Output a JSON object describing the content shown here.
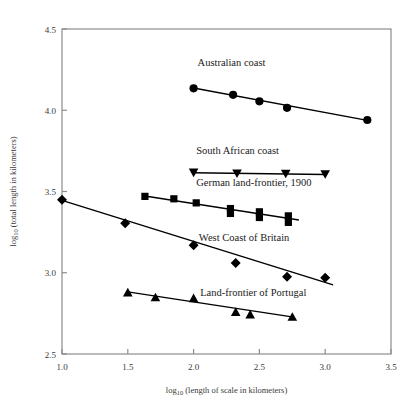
{
  "chart_data": {
    "type": "scatter",
    "title": "",
    "xlabel": "log10 (length of scale in kilometers)",
    "ylabel": "log10 (total length in kilometers)",
    "xlim": [
      1.0,
      3.5
    ],
    "ylim": [
      2.5,
      4.5
    ],
    "xticks": [
      "1.0",
      "1.5",
      "2.0",
      "2.5",
      "3.0",
      "3.5"
    ],
    "xtick_values": [
      1.0,
      1.5,
      2.0,
      2.5,
      3.0,
      3.5
    ],
    "yticks": [
      "2.5",
      "3.0",
      "3.5",
      "4.0",
      "4.5"
    ],
    "ytick_values": [
      2.5,
      3.0,
      3.5,
      4.0,
      4.5
    ],
    "grid": false,
    "legend_position": "inline-annotations",
    "marker_color": "#000000",
    "line_color": "#000000",
    "frame_color": "#8c8c8c",
    "series": [
      {
        "name": "Australian coast",
        "marker": "circle",
        "label": "Australian coast",
        "label_x": 2.03,
        "label_y": 4.27,
        "points": [
          {
            "x": 2.0,
            "y": 4.135
          },
          {
            "x": 2.3,
            "y": 4.095
          },
          {
            "x": 2.5,
            "y": 4.055
          },
          {
            "x": 2.71,
            "y": 4.015
          },
          {
            "x": 3.32,
            "y": 3.94
          }
        ],
        "fit_line": [
          {
            "x": 2.0,
            "y": 4.137
          },
          {
            "x": 3.32,
            "y": 3.938
          }
        ]
      },
      {
        "name": "South African coast",
        "marker": "triangle-down",
        "label": "South African coast",
        "label_x": 2.02,
        "label_y": 3.73,
        "points": [
          {
            "x": 2.0,
            "y": 3.615
          },
          {
            "x": 2.33,
            "y": 3.61
          },
          {
            "x": 2.7,
            "y": 3.608
          },
          {
            "x": 3.0,
            "y": 3.605
          }
        ],
        "fit_line": [
          {
            "x": 2.0,
            "y": 3.615
          },
          {
            "x": 3.0,
            "y": 3.605
          }
        ]
      },
      {
        "name": "German land-frontier, 1900",
        "marker": "square",
        "label": "German land-frontier, 1900",
        "label_x": 2.02,
        "label_y": 3.535,
        "points": [
          {
            "x": 1.63,
            "y": 3.47
          },
          {
            "x": 1.85,
            "y": 3.455
          },
          {
            "x": 2.02,
            "y": 3.43
          },
          {
            "x": 2.28,
            "y": 3.395
          },
          {
            "x": 2.28,
            "y": 3.365
          },
          {
            "x": 2.5,
            "y": 3.375
          },
          {
            "x": 2.5,
            "y": 3.34
          },
          {
            "x": 2.72,
            "y": 3.35
          },
          {
            "x": 2.72,
            "y": 3.31
          }
        ],
        "fit_line": [
          {
            "x": 1.63,
            "y": 3.472
          },
          {
            "x": 2.8,
            "y": 3.325
          }
        ]
      },
      {
        "name": "West Coast of Britain",
        "marker": "diamond",
        "label": "West Coast of Britain",
        "label_x": 2.04,
        "label_y": 3.195,
        "points": [
          {
            "x": 1.0,
            "y": 3.45
          },
          {
            "x": 1.48,
            "y": 3.305
          },
          {
            "x": 2.0,
            "y": 3.17
          },
          {
            "x": 2.32,
            "y": 3.06
          },
          {
            "x": 2.71,
            "y": 2.975
          },
          {
            "x": 3.0,
            "y": 2.97
          }
        ],
        "fit_line": [
          {
            "x": 1.0,
            "y": 3.445
          },
          {
            "x": 3.06,
            "y": 2.925
          }
        ]
      },
      {
        "name": "Land-frontier of Portugal",
        "marker": "triangle-up",
        "label": "Land-frontier of Portugal",
        "label_x": 2.05,
        "label_y": 2.855,
        "points": [
          {
            "x": 1.5,
            "y": 2.88
          },
          {
            "x": 1.71,
            "y": 2.85
          },
          {
            "x": 2.0,
            "y": 2.845
          },
          {
            "x": 2.32,
            "y": 2.76
          },
          {
            "x": 2.43,
            "y": 2.745
          },
          {
            "x": 2.75,
            "y": 2.73
          }
        ],
        "fit_line": [
          {
            "x": 1.5,
            "y": 2.882
          },
          {
            "x": 2.76,
            "y": 2.727
          }
        ]
      }
    ]
  }
}
